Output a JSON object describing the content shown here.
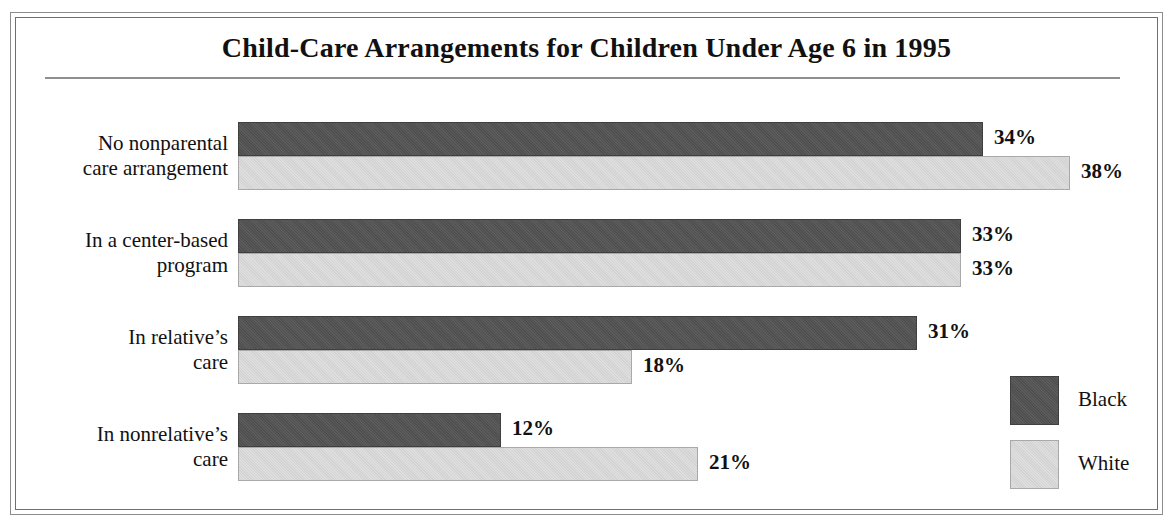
{
  "chart_data": {
    "type": "bar",
    "orientation": "horizontal",
    "title": "Child-Care Arrangements for Children Under Age 6 in 1995",
    "xlabel": "",
    "ylabel": "",
    "xlim": [
      0,
      38
    ],
    "grid": false,
    "legend_position": "bottom-right",
    "value_suffix": "%",
    "categories": [
      "No nonparental care arrangement",
      "In a center-based program",
      "In relative's care",
      "In nonrelative's care"
    ],
    "series": [
      {
        "name": "Black",
        "color": "#535353",
        "values": [
          34,
          33,
          31,
          12
        ]
      },
      {
        "name": "White",
        "color": "#d8d8d8",
        "values": [
          38,
          33,
          18,
          21
        ]
      }
    ]
  },
  "chart": {
    "title": "Child-Care Arrangements for Children Under Age 6 in 1995",
    "groups": [
      {
        "label_line1": "No nonparental",
        "label_line2": "care arrangement",
        "bars": [
          {
            "series": "Black",
            "value": 34,
            "value_label": "34%"
          },
          {
            "series": "White",
            "value": 38,
            "value_label": "38%"
          }
        ]
      },
      {
        "label_line1": "In a center-based",
        "label_line2": "program",
        "bars": [
          {
            "series": "Black",
            "value": 33,
            "value_label": "33%"
          },
          {
            "series": "White",
            "value": 33,
            "value_label": "33%"
          }
        ]
      },
      {
        "label_line1": "In relative’s",
        "label_line2": "care",
        "bars": [
          {
            "series": "Black",
            "value": 31,
            "value_label": "31%"
          },
          {
            "series": "White",
            "value": 18,
            "value_label": "18%"
          }
        ]
      },
      {
        "label_line1": "In nonrelative’s",
        "label_line2": "care",
        "bars": [
          {
            "series": "Black",
            "value": 12,
            "value_label": "12%"
          },
          {
            "series": "White",
            "value": 21,
            "value_label": "21%"
          }
        ]
      }
    ],
    "legend": [
      {
        "label": "Black",
        "color": "#535353"
      },
      {
        "label": "White",
        "color": "#d8d8d8"
      }
    ]
  }
}
